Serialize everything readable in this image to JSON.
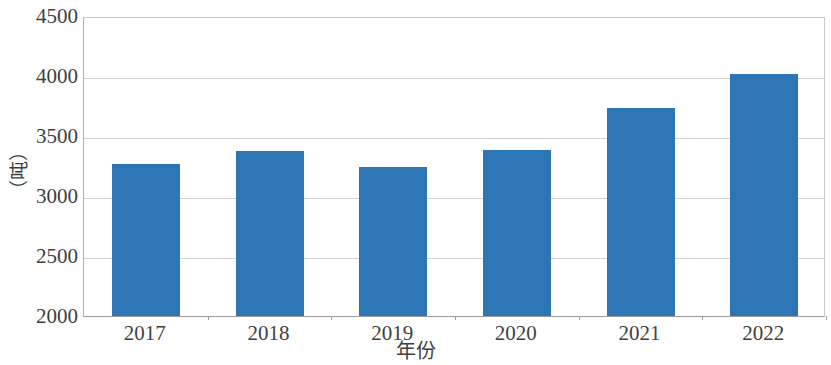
{
  "chart_data": {
    "type": "bar",
    "title": "",
    "subtitle": "",
    "xlabel": "年份",
    "ylabel": "（吨）",
    "categories": [
      "2017",
      "2018",
      "2019",
      "2020",
      "2021",
      "2022"
    ],
    "values": [
      3270,
      3375,
      3240,
      3380,
      3730,
      4020
    ],
    "series": [
      {
        "name": "",
        "values": [
          3270,
          3375,
          3240,
          3380,
          3730,
          4020
        ]
      }
    ],
    "ylim": [
      2000,
      4500
    ],
    "y_ticks": [
      2000,
      2500,
      3000,
      3500,
      4000,
      4500
    ],
    "y_tick_labels": [
      "2000",
      "2500",
      "3000",
      "3500",
      "4000",
      "4500"
    ],
    "x_tick_labels": [
      "2017",
      "2018",
      "2019",
      "2020",
      "2021",
      "2022"
    ],
    "grid": true,
    "grid_axis": "y",
    "legend": false,
    "legend_position": "none",
    "bar_color": "#2e75b6",
    "gridline_color": "#d2d2d2",
    "axis_color": "#9a9a9a",
    "background_color": "#ffffff",
    "annotations": []
  },
  "axis": {
    "y_title": "（吨）",
    "x_title": "年份"
  }
}
